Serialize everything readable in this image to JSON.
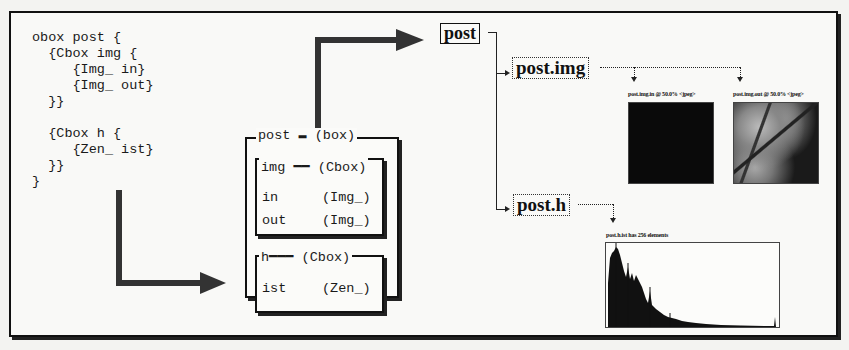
{
  "code": {
    "lines": [
      "obox post {",
      "  {Cbox img {",
      "     {Img_ in}",
      "     {Img_ out}",
      "  }}",
      "",
      "  {Cbox h {",
      "     {Zen_ ist}",
      "  }}",
      "}"
    ]
  },
  "box_structure": {
    "outer": {
      "name": "post",
      "type": "(box)"
    },
    "children": [
      {
        "name": "img",
        "type": "(Cbox)",
        "fields": [
          {
            "name": "in",
            "type": "(Img_)"
          },
          {
            "name": "out",
            "type": "(Img_)"
          }
        ]
      },
      {
        "name": "h",
        "type": "(Cbox)",
        "fields": [
          {
            "name": "ist",
            "type": "(Zen_)"
          }
        ]
      }
    ]
  },
  "tree": {
    "root": "post",
    "img_node": "post.img",
    "h_node": "post.h"
  },
  "images": {
    "in_title": "post.img.in @ 50.0% <jpeg>",
    "out_title": "post.img.out @ 50.0% <jpeg>"
  },
  "histogram": {
    "title": "post.h.ist has 256 elements",
    "element_count": 256
  },
  "colors": {
    "ink": "#111111",
    "paper": "#f9f9f7",
    "arrow": "#333333"
  }
}
